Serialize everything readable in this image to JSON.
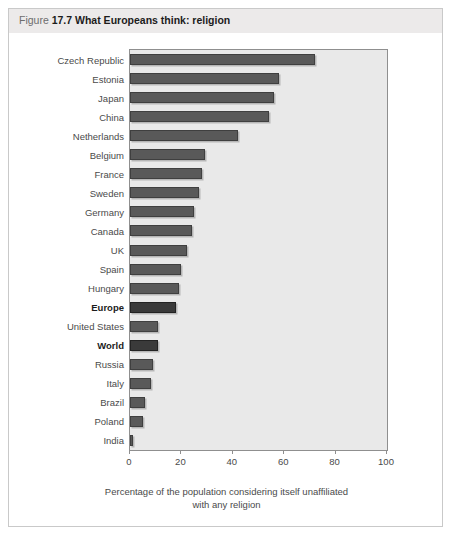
{
  "figure": {
    "label_word": "Figure",
    "number": "17.7",
    "title": "What Europeans think: religion"
  },
  "colors": {
    "bar": "#595959",
    "bar_highlight": "#3a3a3a",
    "plot_background": "#e9e9e9",
    "header_background": "#eceaea",
    "axis": "#8f8f8f"
  },
  "chart_data": {
    "type": "bar",
    "orientation": "horizontal",
    "title": "What Europeans think: religion",
    "xlabel": "Percentage of the population considering itself unaffiliated with any religion",
    "ylabel": "",
    "xlim": [
      0,
      100
    ],
    "grid": false,
    "legend": false,
    "xticks": [
      0,
      20,
      40,
      60,
      80,
      100
    ],
    "xtick_labels": [
      "0",
      "20",
      "40",
      "60",
      "80",
      "100"
    ],
    "categories": [
      "Czech Republic",
      "Estonia",
      "Japan",
      "China",
      "Netherlands",
      "Belgium",
      "France",
      "Sweden",
      "Germany",
      "Canada",
      "UK",
      "Spain",
      "Hungary",
      "Europe",
      "United States",
      "World",
      "Russia",
      "Italy",
      "Brazil",
      "Poland",
      "India"
    ],
    "values": [
      72,
      58,
      56,
      54,
      42,
      29,
      28,
      27,
      25,
      24,
      22,
      20,
      19,
      18,
      11,
      11,
      9,
      8,
      6,
      5,
      1
    ],
    "highlighted": [
      "Europe",
      "World"
    ],
    "caption_line1": "Percentage of the population considering itself unaffiliated",
    "caption_line2": "with any religion"
  }
}
